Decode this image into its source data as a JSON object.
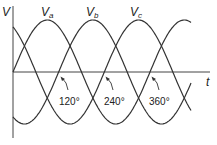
{
  "diagram": {
    "y_axis_label": "V",
    "x_axis_label": "t",
    "series": [
      {
        "name": "Va",
        "main": "V",
        "sub": "a",
        "phase_deg": 0
      },
      {
        "name": "Vb",
        "main": "V",
        "sub": "b",
        "phase_deg": -120
      },
      {
        "name": "Vc",
        "main": "V",
        "sub": "c",
        "phase_deg": -240
      }
    ],
    "annotations": [
      {
        "label": "120°"
      },
      {
        "label": "240°"
      },
      {
        "label": "360°"
      }
    ],
    "line_color": "#333333"
  }
}
